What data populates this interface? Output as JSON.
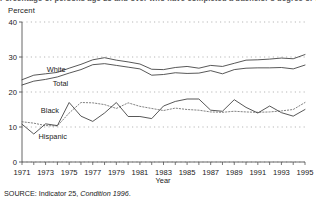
{
  "figure": {
    "title": "Percentage of persons age 25 and over who have completed a bachelor's degree or higher: 1971 to 1995",
    "y_axis_unit_label": "Percent",
    "x_axis_title": "Year",
    "source_prefix": "SOURCE:",
    "source_main": "Indicator 25,",
    "source_italic": "Condition 1996",
    "source_suffix": "."
  },
  "chart_data": {
    "type": "line",
    "title": "Percentage of persons age 25 and over who have completed a bachelor's degree or higher: 1971 to 1995",
    "xlabel": "Year",
    "ylabel": "Percent",
    "xlim": [
      1971,
      1995
    ],
    "ylim": [
      0,
      40
    ],
    "yticks": [
      0,
      10,
      20,
      30,
      40
    ],
    "xticks": [
      1971,
      1973,
      1975,
      1977,
      1979,
      1981,
      1983,
      1985,
      1987,
      1989,
      1991,
      1993,
      1995
    ],
    "xtick_labels": [
      "1971",
      "1973",
      "1975",
      "1977",
      "1979",
      "1981",
      "1983",
      "1985",
      "1987",
      "1989",
      "1991",
      "1993",
      "1995"
    ],
    "ytick_labels": [
      "0",
      "10",
      "20",
      "30",
      "40"
    ],
    "grid": "horizontal-dotted",
    "legend": "inline-labels",
    "x": [
      1971,
      1972,
      1973,
      1974,
      1975,
      1976,
      1977,
      1978,
      1979,
      1980,
      1981,
      1982,
      1983,
      1984,
      1985,
      1986,
      1987,
      1988,
      1989,
      1990,
      1991,
      1992,
      1993,
      1994,
      1995
    ],
    "series": [
      {
        "name": "White",
        "style": "solid",
        "label_x": 1973.1,
        "label_y": 25.6,
        "values": [
          23.5,
          24.8,
          25.2,
          25.6,
          26.8,
          27.9,
          29.2,
          29.8,
          29.1,
          28.6,
          28.0,
          26.5,
          26.4,
          27.0,
          27.3,
          26.8,
          27.6,
          27.3,
          28.2,
          29.1,
          29.2,
          29.4,
          29.7,
          29.5,
          30.7
        ]
      },
      {
        "name": "Total",
        "style": "solid",
        "label_x": 1973.6,
        "label_y": 21.8,
        "values": [
          22.0,
          23.1,
          23.6,
          24.3,
          25.4,
          26.4,
          27.8,
          28.1,
          27.6,
          27.1,
          26.6,
          24.8,
          25.0,
          25.5,
          25.3,
          25.4,
          26.1,
          25.2,
          26.4,
          26.8,
          26.9,
          26.9,
          27.0,
          26.6,
          27.7
        ]
      },
      {
        "name": "Black",
        "style": "dotted",
        "label_x": 1972.6,
        "label_y": 14.1,
        "values": [
          11.5,
          11.1,
          10.4,
          10.3,
          14.0,
          17.0,
          16.9,
          16.4,
          15.3,
          16.9,
          15.9,
          15.3,
          14.7,
          15.4,
          15.0,
          14.8,
          14.3,
          14.2,
          14.5,
          14.3,
          14.2,
          14.3,
          14.6,
          15.0,
          17.0
        ]
      },
      {
        "name": "Hispanic",
        "style": "solid",
        "label_x": 1972.4,
        "label_y": 6.5,
        "values": [
          10.8,
          8.0,
          10.9,
          10.4,
          17.0,
          13.1,
          11.6,
          14.0,
          17.0,
          13.0,
          13.0,
          12.4,
          16.0,
          17.3,
          18.0,
          18.0,
          14.8,
          14.5,
          17.8,
          15.6,
          14.0,
          16.0,
          14.1,
          13.1,
          15.0
        ]
      }
    ]
  }
}
